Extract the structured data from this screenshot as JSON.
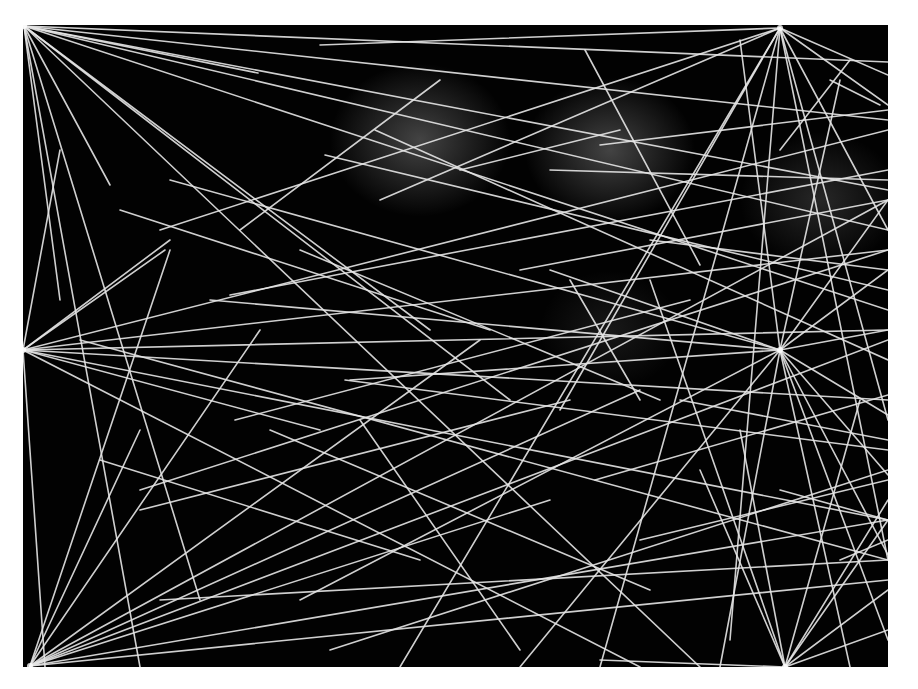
{
  "artwork": {
    "description": "Abstract black panel with straight white lines radiating from several hub points, soft grey glows near the top center",
    "background": "#ffffff",
    "panel": {
      "x": 23,
      "y": 25,
      "w": 865,
      "h": 642,
      "color": "#020202"
    },
    "line_color": "#e6e6e6",
    "glows": [
      {
        "cx": 420,
        "cy": 140,
        "r": 90,
        "opacity": 0.35
      },
      {
        "cx": 610,
        "cy": 150,
        "r": 85,
        "opacity": 0.35
      },
      {
        "cx": 820,
        "cy": 200,
        "r": 80,
        "opacity": 0.2
      },
      {
        "cx": 610,
        "cy": 330,
        "r": 70,
        "opacity": 0.12
      }
    ],
    "hubs": [
      {
        "name": "top-left",
        "x": 24,
        "y": 26
      },
      {
        "name": "top-right",
        "x": 780,
        "y": 28
      },
      {
        "name": "left-mid",
        "x": 23,
        "y": 350
      },
      {
        "name": "right-mid",
        "x": 780,
        "y": 350
      },
      {
        "name": "bottom-left",
        "x": 30,
        "y": 666
      },
      {
        "name": "bottom-right",
        "x": 785,
        "y": 667
      }
    ],
    "lines": [
      [
        24,
        26,
        888,
        62
      ],
      [
        24,
        26,
        258,
        73
      ],
      [
        24,
        26,
        888,
        120
      ],
      [
        24,
        26,
        888,
        190
      ],
      [
        24,
        26,
        888,
        230
      ],
      [
        24,
        26,
        110,
        185
      ],
      [
        24,
        26,
        510,
        400
      ],
      [
        24,
        26,
        430,
        330
      ],
      [
        24,
        26,
        200,
        600
      ],
      [
        24,
        26,
        60,
        300
      ],
      [
        24,
        26,
        888,
        310
      ],
      [
        24,
        26,
        700,
        667
      ],
      [
        24,
        26,
        140,
        667
      ],
      [
        780,
        28,
        320,
        45
      ],
      [
        780,
        28,
        160,
        230
      ],
      [
        780,
        28,
        380,
        200
      ],
      [
        780,
        28,
        888,
        75
      ],
      [
        780,
        28,
        888,
        105
      ],
      [
        780,
        28,
        888,
        230
      ],
      [
        780,
        28,
        560,
        410
      ],
      [
        780,
        28,
        730,
        640
      ],
      [
        780,
        28,
        888,
        560
      ],
      [
        780,
        28,
        600,
        667
      ],
      [
        780,
        28,
        400,
        667
      ],
      [
        780,
        28,
        888,
        420
      ],
      [
        23,
        350,
        165,
        250
      ],
      [
        23,
        350,
        170,
        240
      ],
      [
        23,
        350,
        888,
        130
      ],
      [
        23,
        350,
        888,
        250
      ],
      [
        23,
        350,
        888,
        400
      ],
      [
        23,
        350,
        888,
        520
      ],
      [
        23,
        350,
        320,
        430
      ],
      [
        23,
        350,
        640,
        667
      ],
      [
        23,
        350,
        60,
        150
      ],
      [
        23,
        350,
        888,
        330
      ],
      [
        23,
        350,
        45,
        667
      ],
      [
        780,
        350,
        888,
        200
      ],
      [
        780,
        350,
        888,
        270
      ],
      [
        780,
        350,
        888,
        330
      ],
      [
        780,
        350,
        888,
        415
      ],
      [
        780,
        350,
        888,
        475
      ],
      [
        780,
        350,
        888,
        555
      ],
      [
        780,
        350,
        350,
        380
      ],
      [
        780,
        350,
        210,
        300
      ],
      [
        780,
        350,
        170,
        180
      ],
      [
        780,
        350,
        550,
        270
      ],
      [
        780,
        350,
        520,
        667
      ],
      [
        780,
        350,
        720,
        667
      ],
      [
        780,
        350,
        850,
        667
      ],
      [
        780,
        350,
        740,
        40
      ],
      [
        780,
        350,
        840,
        80
      ],
      [
        780,
        350,
        300,
        600
      ],
      [
        780,
        350,
        888,
        640
      ],
      [
        30,
        666,
        170,
        250
      ],
      [
        30,
        666,
        260,
        330
      ],
      [
        30,
        666,
        480,
        340
      ],
      [
        30,
        666,
        888,
        200
      ],
      [
        30,
        666,
        888,
        340
      ],
      [
        30,
        666,
        640,
        390
      ],
      [
        30,
        666,
        888,
        520
      ],
      [
        30,
        666,
        888,
        580
      ],
      [
        30,
        666,
        140,
        430
      ],
      [
        30,
        666,
        550,
        500
      ],
      [
        785,
        667,
        888,
        520
      ],
      [
        785,
        667,
        888,
        590
      ],
      [
        785,
        667,
        888,
        630
      ],
      [
        785,
        667,
        650,
        280
      ],
      [
        785,
        667,
        740,
        430
      ],
      [
        785,
        667,
        700,
        470
      ],
      [
        785,
        667,
        600,
        660
      ],
      [
        785,
        667,
        888,
        500
      ],
      [
        785,
        667,
        860,
        400
      ],
      [
        375,
        130,
        888,
        360
      ],
      [
        230,
        295,
        888,
        170
      ],
      [
        345,
        380,
        888,
        450
      ],
      [
        140,
        490,
        888,
        250
      ],
      [
        140,
        510,
        570,
        400
      ],
      [
        600,
        145,
        888,
        110
      ],
      [
        550,
        170,
        888,
        180
      ],
      [
        440,
        80,
        240,
        230
      ],
      [
        325,
        155,
        888,
        290
      ],
      [
        640,
        540,
        888,
        480
      ],
      [
        595,
        480,
        888,
        395
      ],
      [
        780,
        490,
        888,
        520
      ],
      [
        585,
        50,
        700,
        265
      ],
      [
        300,
        250,
        660,
        400
      ],
      [
        120,
        210,
        490,
        330
      ],
      [
        880,
        105,
        830,
        80
      ],
      [
        650,
        240,
        888,
        270
      ],
      [
        520,
        270,
        888,
        200
      ],
      [
        270,
        430,
        650,
        590
      ],
      [
        330,
        650,
        888,
        470
      ],
      [
        235,
        420,
        690,
        300
      ],
      [
        570,
        280,
        640,
        400
      ],
      [
        460,
        170,
        620,
        130
      ],
      [
        780,
        150,
        850,
        60
      ],
      [
        680,
        400,
        888,
        440
      ],
      [
        360,
        420,
        520,
        650
      ],
      [
        840,
        560,
        888,
        540
      ],
      [
        160,
        600,
        888,
        560
      ],
      [
        100,
        460,
        420,
        560
      ],
      [
        80,
        340,
        888,
        560
      ]
    ]
  }
}
